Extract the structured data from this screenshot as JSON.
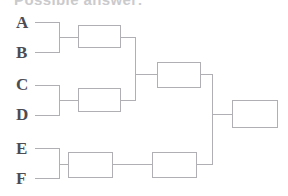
{
  "caption": {
    "fragment_text": "Possible answer:"
  },
  "diagram": {
    "line_color": "#b0b0b4",
    "label_color": "#4c4c52",
    "background_color": "#ffffff",
    "seeds": [
      {
        "id": "seed-a",
        "label": "A",
        "x": 16,
        "y": 14
      },
      {
        "id": "seed-b",
        "label": "B",
        "x": 16,
        "y": 44
      },
      {
        "id": "seed-c",
        "label": "C",
        "x": 16,
        "y": 76
      },
      {
        "id": "seed-d",
        "label": "D",
        "x": 16,
        "y": 106
      },
      {
        "id": "seed-e",
        "label": "F",
        "x": 16,
        "y": 140
      },
      {
        "id": "seed-f",
        "label": "F",
        "x": 16,
        "y": 170
      }
    ],
    "seed_labels_ordered": [
      "A",
      "B",
      "C",
      "D",
      "E",
      "F"
    ],
    "rounds": [
      {
        "name": "round-one",
        "matches": [
          {
            "id": "match-ab",
            "entrants": [
              "A",
              "B"
            ],
            "winner": "",
            "x": 78,
            "y": 25,
            "w": 43,
            "h": 23
          },
          {
            "id": "match-cd",
            "entrants": [
              "C",
              "D"
            ],
            "winner": "",
            "x": 78,
            "y": 88,
            "w": 43,
            "h": 24
          },
          {
            "id": "match-ef",
            "entrants": [
              "E",
              "F"
            ],
            "winner": "",
            "x": 68,
            "y": 152,
            "w": 45,
            "h": 26
          }
        ]
      },
      {
        "name": "round-two",
        "matches": [
          {
            "id": "match-semifinal-top",
            "entrants": [],
            "winner": "",
            "x": 157,
            "y": 62,
            "w": 44,
            "h": 26
          },
          {
            "id": "match-semifinal-bottom",
            "entrants": [],
            "winner": "",
            "x": 152,
            "y": 152,
            "w": 45,
            "h": 26
          }
        ]
      },
      {
        "name": "final",
        "matches": [
          {
            "id": "match-final",
            "entrants": [],
            "winner": "",
            "x": 232,
            "y": 100,
            "w": 46,
            "h": 28
          }
        ]
      }
    ],
    "match_count": 6,
    "empty_boxes": true
  }
}
